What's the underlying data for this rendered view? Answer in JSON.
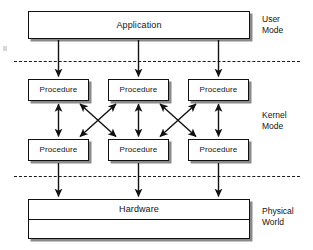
{
  "diagram": {
    "colors": {
      "stroke": "#111111",
      "shadow": "#8a8a8a",
      "background": "#ffffff",
      "text": "#141414"
    },
    "application": {
      "label": "Application"
    },
    "hardware": {
      "label": "Hardware"
    },
    "procedures": {
      "row_top": [
        {
          "label": "Procedure"
        },
        {
          "label": "Procedure"
        },
        {
          "label": "Procedure"
        }
      ],
      "row_bottom": [
        {
          "label": "Procedure"
        },
        {
          "label": "Procedure"
        },
        {
          "label": "Procedure"
        }
      ]
    },
    "zones": [
      {
        "id": "user",
        "label": "User\nMode"
      },
      {
        "id": "kernel",
        "label": "Kernel\nMode"
      },
      {
        "id": "physical",
        "label": "Physical\nWorld"
      }
    ],
    "separators": [
      {
        "id": "user-kernel",
        "style": "dashed"
      },
      {
        "id": "kernel-physical",
        "style": "dashed"
      }
    ],
    "connectors": {
      "application_to_procedures": {
        "direction": "down",
        "count": 3,
        "heads": "single"
      },
      "procedure_vertical": {
        "direction": "both",
        "count": 3,
        "heads": "double"
      },
      "procedure_diagonal": {
        "direction": "both",
        "count": 4,
        "heads": "double",
        "pattern": "crossed-x"
      },
      "procedures_to_hardware": {
        "direction": "down",
        "count": 3,
        "heads": "single"
      }
    }
  }
}
